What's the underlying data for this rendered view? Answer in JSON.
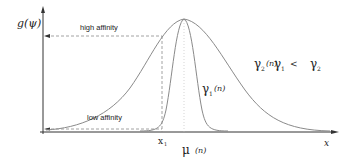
{
  "figure": {
    "y_axis_label": "g(ψ)",
    "x_axis_label": "x",
    "annotations": {
      "high_affinity": "high affinity",
      "low_affinity": "low affinity",
      "x1_label": "x",
      "x1_sub": "1",
      "mu_label": "μ",
      "mu_arg": "(n)"
    },
    "curves": [
      {
        "name": "gamma2",
        "label": "γ",
        "sub": "2",
        "arg": "(n)",
        "width": "wide"
      },
      {
        "name": "gamma1",
        "label": "γ",
        "sub": "1",
        "arg": "(n)",
        "width": "narrow"
      }
    ],
    "relation": {
      "left": "γ",
      "left_sub": "1",
      "op": "<",
      "right": "γ",
      "right_sub": "2"
    },
    "colors": {
      "axis": "#333333",
      "curve": "#8a8a8a",
      "dashed": "#8a8a8a",
      "text": "#222222"
    }
  }
}
